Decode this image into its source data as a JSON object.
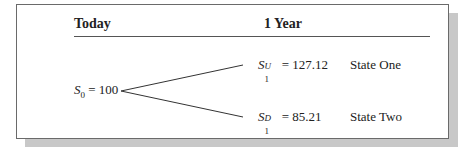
{
  "headers": {
    "today": "Today",
    "one_year": "1 Year"
  },
  "root": {
    "symbol": "S",
    "subscript": "0",
    "equals": "= 100"
  },
  "up": {
    "symbol": "S",
    "superscript": "U",
    "subscript": "1",
    "equals": "= 127.12",
    "label": "State One"
  },
  "down": {
    "symbol": "S",
    "superscript": "D",
    "subscript": "1",
    "equals": "= 85.21",
    "label": "State Two"
  }
}
